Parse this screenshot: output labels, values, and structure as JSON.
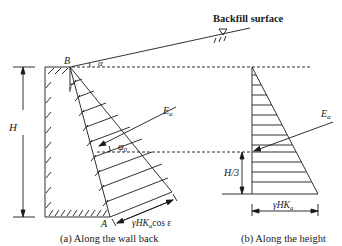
{
  "figure": {
    "labels": {
      "backfill_surface": "Backfill surface",
      "point_B": "B",
      "point_A": "A",
      "alpha": "α",
      "epsilon": "ε",
      "height": "H",
      "phi0": "φ",
      "phi0_sub": "0",
      "ea_left": "E",
      "ea_left_sub": "a",
      "ea_right": "E",
      "ea_right_sub": "a",
      "h_third": "H/3",
      "dim_left": "γHK",
      "dim_left_sub": "a",
      "dim_left_suffix": "cos ε",
      "dim_right": "γHK",
      "dim_right_sub": "a"
    },
    "captions": {
      "a": "(a) Along the wall back",
      "b": "(b) Along the height"
    },
    "colors": {
      "stroke": "#1a1a1a",
      "background": "#ffffff"
    }
  }
}
